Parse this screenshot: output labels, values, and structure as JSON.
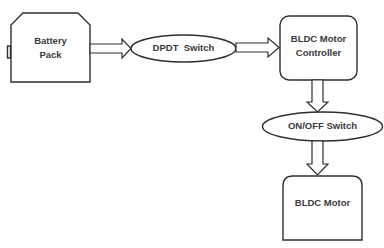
{
  "diagram": {
    "type": "block-diagram",
    "nodes": [
      {
        "id": "battery",
        "shape": "chamfered-rectangle",
        "label_line1": "Battery",
        "label_line2": "Pack"
      },
      {
        "id": "dpdt",
        "shape": "ellipse",
        "label": "DPDT  Switch"
      },
      {
        "id": "controller",
        "shape": "rounded-rectangle",
        "label_line1": "BLDC Motor",
        "label_line2": "Controller"
      },
      {
        "id": "onoff",
        "shape": "ellipse",
        "label": "ON/OFF Switch"
      },
      {
        "id": "motor",
        "shape": "top-rounded-rectangle",
        "label": "BLDC Motor"
      }
    ],
    "edges": [
      {
        "from": "battery",
        "to": "dpdt",
        "style": "block-arrow",
        "direction": "right"
      },
      {
        "from": "dpdt",
        "to": "controller",
        "style": "block-arrow",
        "direction": "right"
      },
      {
        "from": "controller",
        "to": "onoff",
        "style": "block-arrow",
        "direction": "down"
      },
      {
        "from": "onoff",
        "to": "motor",
        "style": "block-arrow",
        "direction": "down"
      }
    ],
    "colors": {
      "stroke": "#2f2f2f",
      "fill": "#ffffff",
      "text": "#3a3a3a",
      "background": "#ffffff"
    }
  }
}
